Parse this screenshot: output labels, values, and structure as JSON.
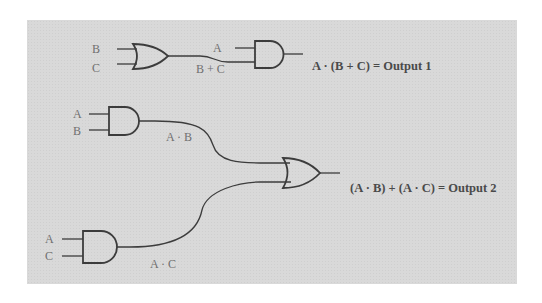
{
  "diagram": {
    "type": "logic-circuit",
    "background_color": "#d9d9d9",
    "line_color": "#3c3c3c",
    "circuit1": {
      "or_gate": {
        "inputs": [
          "B",
          "C"
        ],
        "output_label": "B + C"
      },
      "and_gate": {
        "inputs": [
          "A",
          "B + C"
        ]
      },
      "equation": "A · (B + C)  = Output 1"
    },
    "circuit2": {
      "and_gate_top": {
        "inputs": [
          "A",
          "B"
        ],
        "output_label": "A · B"
      },
      "and_gate_bottom": {
        "inputs": [
          "A",
          "C"
        ],
        "output_label": "A · C"
      },
      "or_gate": {
        "inputs": [
          "A · B",
          "A · C"
        ]
      },
      "equation": "(A · B) + (A · C) = Output 2"
    }
  }
}
